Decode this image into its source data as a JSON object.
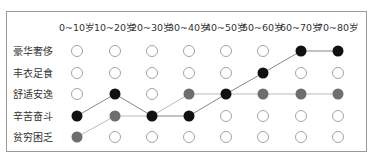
{
  "chart_data": {
    "type": "scatter",
    "title": "",
    "xlabel": "",
    "ylabel": "",
    "categories": [
      "0~10岁",
      "10~20岁",
      "20~30岁",
      "30~40岁",
      "40~50岁",
      "50~60岁",
      "60~70岁",
      "70~80岁"
    ],
    "levels": [
      "豪华奢侈",
      "丰衣足食",
      "舒适安逸",
      "辛苦奋斗",
      "贫穷困乏"
    ],
    "series": [
      {
        "name": "black",
        "color": "#111111",
        "line_color": "#888888",
        "values": [
          "辛苦奋斗",
          "舒适安逸",
          "辛苦奋斗",
          "辛苦奋斗",
          "舒适安逸",
          "丰衣足食",
          "豪华奢侈",
          "豪华奢侈"
        ]
      },
      {
        "name": "gray",
        "color": "#6e6e6e",
        "line_color": "#bbbbbb",
        "values": [
          "贫穷困乏",
          "辛苦奋斗",
          "辛苦奋斗",
          "舒适安逸",
          "舒适安逸",
          "舒适安逸",
          "舒适安逸",
          "舒适安逸"
        ]
      }
    ],
    "empty_marker": "open-circle",
    "grid": false,
    "legend": "none"
  },
  "colors": {
    "frame": "#9a9a9a",
    "empty_circle": "#9a9a9a",
    "text": "#333333"
  }
}
